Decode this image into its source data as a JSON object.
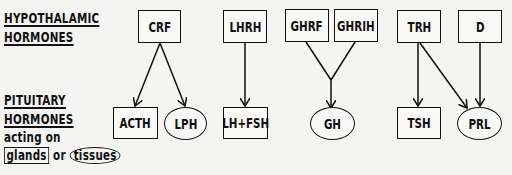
{
  "labels": {
    "hypo_line1": "HYPOTHALAMIC",
    "hypo_line2": "HORMONES",
    "pit_line1": "PITUITARY",
    "pit_line2": "HORMONES",
    "pit_line3": "acting on",
    "legend_glands": "glands",
    "legend_or": "or",
    "legend_tissues": "tissues"
  },
  "hypothalamic": [
    {
      "id": "crf",
      "label": "CRF"
    },
    {
      "id": "lhrh",
      "label": "LHRH"
    },
    {
      "id": "ghrf",
      "label": "GHRF"
    },
    {
      "id": "ghrih",
      "label": "GHRIH"
    },
    {
      "id": "trh",
      "label": "TRH"
    },
    {
      "id": "d",
      "label": "D"
    }
  ],
  "pituitary": [
    {
      "id": "acth",
      "label": "ACTH",
      "target": "gland"
    },
    {
      "id": "lph",
      "label": "LPH",
      "target": "tissue"
    },
    {
      "id": "lhfsh",
      "label": "LH+FSH",
      "target": "gland"
    },
    {
      "id": "gh",
      "label": "GH",
      "target": "tissue"
    },
    {
      "id": "tsh",
      "label": "TSH",
      "target": "gland"
    },
    {
      "id": "prl",
      "label": "PRL",
      "target": "tissue"
    }
  ],
  "edges": [
    [
      "CRF",
      "ACTH"
    ],
    [
      "CRF",
      "LPH"
    ],
    [
      "LHRH",
      "LH+FSH"
    ],
    [
      "GHRF",
      "GH"
    ],
    [
      "GHRIH",
      "GH"
    ],
    [
      "TRH",
      "TSH"
    ],
    [
      "TRH",
      "PRL"
    ],
    [
      "D",
      "PRL"
    ]
  ]
}
